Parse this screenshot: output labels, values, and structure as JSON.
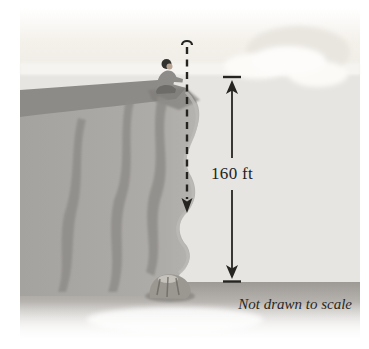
{
  "figure": {
    "height_label": "160 ft",
    "scale_note": "Not drawn to scale"
  },
  "colors": {
    "page_bg": "#ffffff",
    "backdrop": "#e7e5e1",
    "sky": "#f2efe9",
    "horizon": "#f7f6f2",
    "cloud": "#fbfaf6",
    "cloud_shade": "#e9e6e0",
    "cliff_top": "#8d8b87",
    "cliff_face": "#a9a7a3",
    "cliff_streak": "#8f8d89",
    "mound": "#9b9791",
    "ground": "#9d9a96",
    "ink": "#262420"
  }
}
